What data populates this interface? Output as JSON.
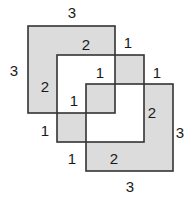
{
  "diagram": {
    "fill_color": "#dcdcdc",
    "stroke_color": "#333333",
    "unit_px": 29,
    "origin": [
      28,
      26
    ],
    "squares": [
      {
        "x": 0,
        "y": 0,
        "size": 3
      },
      {
        "x": 1,
        "y": 1,
        "size": 3
      },
      {
        "x": 2,
        "y": 2,
        "size": 3
      }
    ],
    "labels": [
      {
        "text": "3",
        "x": 72,
        "y": 18
      },
      {
        "text": "3",
        "x": 14,
        "y": 76
      },
      {
        "text": "2",
        "x": 86,
        "y": 50
      },
      {
        "text": "2",
        "x": 45,
        "y": 92
      },
      {
        "text": "1",
        "x": 128,
        "y": 48
      },
      {
        "text": "1",
        "x": 100,
        "y": 78
      },
      {
        "text": "1",
        "x": 157,
        "y": 78
      },
      {
        "text": "1",
        "x": 74,
        "y": 106
      },
      {
        "text": "2",
        "x": 152,
        "y": 118
      },
      {
        "text": "3",
        "x": 180,
        "y": 138
      },
      {
        "text": "1",
        "x": 45,
        "y": 136
      },
      {
        "text": "1",
        "x": 72,
        "y": 164
      },
      {
        "text": "2",
        "x": 114,
        "y": 164
      },
      {
        "text": "3",
        "x": 130,
        "y": 192
      }
    ]
  }
}
